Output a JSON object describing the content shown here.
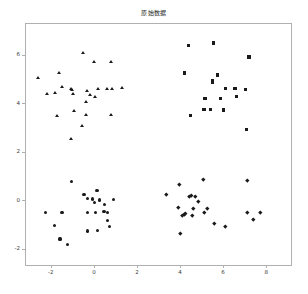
{
  "figure": {
    "background_color": "#ffffff",
    "marker_color": "#1a1a1a",
    "axis_color": "#b0b0b0"
  },
  "chart_data": {
    "type": "scatter",
    "title": "原始数据",
    "xlabel": "",
    "ylabel": "",
    "xlim": [
      -3.2,
      9.2
    ],
    "ylim": [
      -2.7,
      7.3
    ],
    "grid": false,
    "legend": null,
    "xticks": [
      -2,
      0,
      2,
      4,
      6,
      8
    ],
    "xticklabels": [
      "-2",
      "0",
      "2",
      "4",
      "6",
      "8"
    ],
    "yticks": [
      -2,
      0,
      2,
      4,
      6
    ],
    "yticklabels": [
      "-2",
      "0",
      "2",
      "4",
      "6"
    ],
    "series": [
      {
        "name": "cluster-1",
        "marker": "triangle",
        "color": "#1a1a1a",
        "points": [
          [
            -2.62,
            5.09
          ],
          [
            -1.66,
            5.27
          ],
          [
            -1.53,
            4.72
          ],
          [
            -1.86,
            4.45
          ],
          [
            -1.09,
            4.6
          ],
          [
            -1.04,
            4.56
          ],
          [
            -1.02,
            4.43
          ],
          [
            -2.2,
            4.42
          ],
          [
            -0.55,
            6.08
          ],
          [
            -0.03,
            5.71
          ],
          [
            0.73,
            5.73
          ],
          [
            -0.36,
            4.53
          ],
          [
            -0.22,
            4.37
          ],
          [
            0.17,
            4.6
          ],
          [
            0.02,
            4.28
          ],
          [
            0.57,
            4.6
          ],
          [
            0.81,
            4.62
          ],
          [
            1.26,
            4.66
          ],
          [
            -0.41,
            4.1
          ],
          [
            -0.95,
            3.73
          ],
          [
            -1.74,
            3.52
          ],
          [
            -0.41,
            3.53
          ],
          [
            0.74,
            3.55
          ],
          [
            -0.6,
            3.08
          ],
          [
            -1.09,
            2.54
          ]
        ]
      },
      {
        "name": "cluster-2",
        "marker": "square",
        "color": "#1a1a1a",
        "points": [
          [
            4.35,
            6.42
          ],
          [
            5.5,
            6.52
          ],
          [
            7.16,
            5.94
          ],
          [
            4.15,
            5.28
          ],
          [
            5.71,
            5.2
          ],
          [
            5.46,
            4.99
          ],
          [
            5.45,
            4.9
          ],
          [
            6.08,
            4.63
          ],
          [
            6.51,
            4.65
          ],
          [
            7.0,
            4.6
          ],
          [
            5.08,
            4.25
          ],
          [
            5.13,
            4.23
          ],
          [
            5.83,
            4.25
          ],
          [
            6.57,
            4.32
          ],
          [
            5.07,
            3.79
          ],
          [
            5.36,
            3.78
          ],
          [
            5.99,
            3.76
          ],
          [
            4.45,
            3.52
          ],
          [
            7.03,
            2.96
          ]
        ]
      },
      {
        "name": "cluster-3",
        "marker": "circle",
        "color": "#1a1a1a",
        "points": [
          [
            -1.1,
            0.82
          ],
          [
            -0.51,
            0.3
          ],
          [
            0.1,
            0.44
          ],
          [
            -0.33,
            0.13
          ],
          [
            -0.1,
            0.1
          ],
          [
            0.22,
            0.06
          ],
          [
            -0.03,
            -0.05
          ],
          [
            0.46,
            -0.13
          ],
          [
            0.86,
            0.08
          ],
          [
            0.42,
            -0.42
          ],
          [
            0.6,
            -0.46
          ],
          [
            -2.28,
            -0.46
          ],
          [
            -1.53,
            -0.46
          ],
          [
            -0.33,
            -0.46
          ],
          [
            0.04,
            -0.47
          ],
          [
            0.6,
            -0.78
          ],
          [
            0.66,
            -1.04
          ],
          [
            -1.86,
            -1.0
          ],
          [
            -0.33,
            -1.22
          ],
          [
            0.12,
            -1.19
          ],
          [
            -1.62,
            -1.55
          ],
          [
            -1.28,
            -1.77
          ]
        ]
      },
      {
        "name": "cluster-4",
        "marker": "diamond",
        "color": "#1a1a1a",
        "points": [
          [
            3.91,
            0.72
          ],
          [
            5.05,
            0.89
          ],
          [
            7.07,
            0.88
          ],
          [
            3.33,
            0.31
          ],
          [
            4.39,
            0.22
          ],
          [
            4.47,
            0.27
          ],
          [
            4.64,
            0.22
          ],
          [
            4.79,
            0.01
          ],
          [
            3.89,
            -0.26
          ],
          [
            4.58,
            -0.28
          ],
          [
            5.2,
            -0.27
          ],
          [
            4.21,
            -0.47
          ],
          [
            4.13,
            -0.53
          ],
          [
            4.05,
            -0.56
          ],
          [
            4.54,
            -0.58
          ],
          [
            5.07,
            -0.44
          ],
          [
            7.07,
            -0.44
          ],
          [
            7.66,
            -0.46
          ],
          [
            7.35,
            -0.72
          ],
          [
            5.54,
            -0.9
          ],
          [
            6.05,
            -1.03
          ],
          [
            3.95,
            -1.32
          ]
        ]
      }
    ]
  }
}
